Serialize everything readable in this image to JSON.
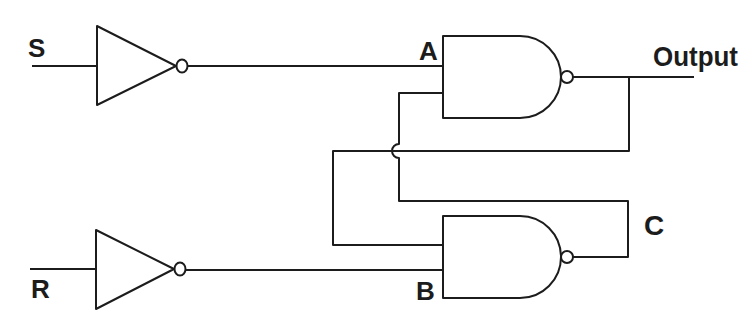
{
  "diagram": {
    "labels": {
      "s_input": "S",
      "r_input": "R",
      "node_a": "A",
      "node_b": "B",
      "node_c": "C",
      "output": "Output"
    },
    "components": [
      {
        "type": "NOT",
        "name": "inverter-s",
        "input": "S",
        "output": "A"
      },
      {
        "type": "NOT",
        "name": "inverter-r",
        "input": "R",
        "output": "B"
      },
      {
        "type": "NAND",
        "name": "nand-top",
        "inputs": [
          "A",
          "C"
        ],
        "output": "Output"
      },
      {
        "type": "NAND",
        "name": "nand-bottom",
        "inputs": [
          "Output",
          "B"
        ],
        "output": "C"
      }
    ],
    "colors": {
      "stroke": "#1c1c1c",
      "background": "#ffffff"
    }
  }
}
